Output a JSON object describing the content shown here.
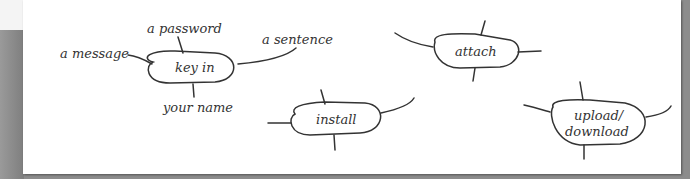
{
  "diagram": {
    "nodes": [
      {
        "id": "key-in",
        "label": "key in",
        "branches": [
          "a message",
          "a password",
          "a sentence",
          "your name"
        ]
      },
      {
        "id": "install",
        "label": "install",
        "branches": []
      },
      {
        "id": "attach",
        "label": "attach",
        "branches": []
      },
      {
        "id": "upload-download",
        "label_line1": "upload/",
        "label_line2": "download",
        "branches": []
      }
    ]
  },
  "colors": {
    "background": "#8c8c8c",
    "card": "#ffffff",
    "ink": "#333333"
  }
}
